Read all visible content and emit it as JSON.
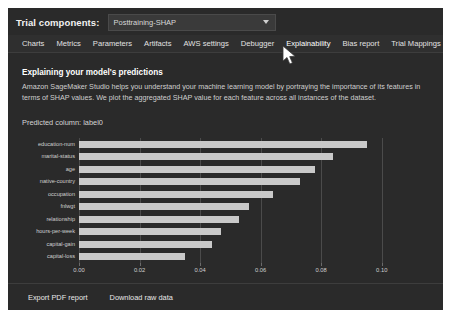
{
  "trial": {
    "label": "Trial components:",
    "selected": "Posttraining-SHAP",
    "caret_icon": "chevron-down-icon"
  },
  "tabs": [
    {
      "label": "Charts",
      "active": false
    },
    {
      "label": "Metrics",
      "active": false
    },
    {
      "label": "Parameters",
      "active": false
    },
    {
      "label": "Artifacts",
      "active": false
    },
    {
      "label": "AWS settings",
      "active": false
    },
    {
      "label": "Debugger",
      "active": false
    },
    {
      "label": "Explainability",
      "active": true
    },
    {
      "label": "Bias report",
      "active": false
    },
    {
      "label": "Trial Mappings",
      "active": false
    }
  ],
  "section": {
    "title": "Explaining your model's predictions",
    "description": "Amazon SageMaker Studio helps you understand your machine learning model by portraying the importance of its features in terms of SHAP values. We plot the aggregated SHAP value for each feature across all instances of the dataset.",
    "predicted_column": "Predicted column: label0"
  },
  "footer": {
    "export_pdf": "Export PDF report",
    "download_raw": "Download raw data"
  },
  "colors": {
    "panel_bg": "#2a2a2a",
    "bar": "#c9c9c9",
    "grid": "#4b4b4b",
    "text": "#e2e2e2"
  },
  "chart_data": {
    "type": "bar",
    "orientation": "horizontal",
    "title": "",
    "xlabel": "",
    "ylabel": "",
    "xlim": [
      0.0,
      0.11
    ],
    "xticks": [
      "0.00",
      "0.02",
      "0.04",
      "0.06",
      "0.08",
      "0.10"
    ],
    "xtick_values": [
      0.0,
      0.02,
      0.04,
      0.06,
      0.08,
      0.1
    ],
    "grid": true,
    "legend": "none",
    "categories": [
      "education-num",
      "marital-status",
      "age",
      "native-country",
      "occupation",
      "fnlwgt",
      "relationship",
      "hours-per-week",
      "capital-gain",
      "capital-loss"
    ],
    "values": [
      0.095,
      0.084,
      0.078,
      0.073,
      0.064,
      0.056,
      0.053,
      0.047,
      0.044,
      0.035
    ]
  }
}
